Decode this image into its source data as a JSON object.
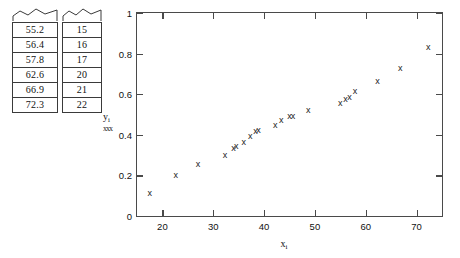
{
  "tables": {
    "x_column": {
      "name": "x-values-strip",
      "values": [
        "55.2",
        "56.4",
        "57.8",
        "62.6",
        "66.9",
        "72.3"
      ]
    },
    "i_column": {
      "name": "index-values-strip",
      "values": [
        "15",
        "16",
        "17",
        "20",
        "21",
        "22"
      ]
    }
  },
  "chart_data": {
    "type": "scatter",
    "title": "",
    "xlabel": "x_i",
    "ylabel": "y_i",
    "xlim": [
      15,
      75
    ],
    "ylim": [
      0,
      1
    ],
    "xticks": [
      20,
      30,
      40,
      50,
      60,
      70
    ],
    "xtick_labels": [
      "20",
      "30",
      "40",
      "50",
      "60",
      "70"
    ],
    "yticks": [
      0,
      0.2,
      0.4,
      0.6,
      0.8,
      1
    ],
    "ytick_labels": [
      "0",
      "0.2",
      "0.4",
      "0.6",
      "0.8",
      "1"
    ],
    "grid": false,
    "legend": null,
    "marker": "x",
    "marker_color": "#222222",
    "series": [
      {
        "name": "sample",
        "points": [
          [
            17.5,
            0.11
          ],
          [
            22.6,
            0.2
          ],
          [
            27.0,
            0.255
          ],
          [
            32.3,
            0.298
          ],
          [
            34.0,
            0.332
          ],
          [
            34.5,
            0.341
          ],
          [
            36.0,
            0.362
          ],
          [
            37.3,
            0.392
          ],
          [
            38.3,
            0.418
          ],
          [
            38.9,
            0.421
          ],
          [
            42.2,
            0.445
          ],
          [
            43.4,
            0.47
          ],
          [
            45.0,
            0.488
          ],
          [
            45.7,
            0.492
          ],
          [
            48.7,
            0.52
          ],
          [
            55.0,
            0.553
          ],
          [
            56.0,
            0.575
          ],
          [
            56.8,
            0.585
          ],
          [
            57.9,
            0.611
          ],
          [
            62.3,
            0.665
          ],
          [
            66.8,
            0.725
          ],
          [
            72.3,
            0.83
          ]
        ]
      }
    ]
  },
  "axis_labels": {
    "y_main": "y",
    "y_sub": "i",
    "y_smudge": "xxx",
    "x_main": "x",
    "x_sub": "i"
  }
}
